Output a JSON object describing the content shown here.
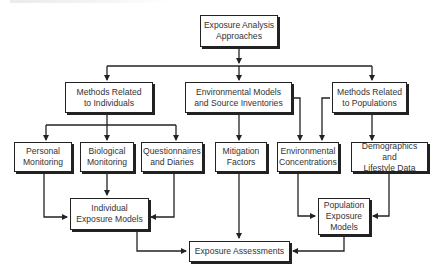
{
  "diagram": {
    "nodes": {
      "root": {
        "line1": "Exposure Analysis",
        "line2": "Approaches"
      },
      "individuals": {
        "line1": "Methods Related",
        "line2": "to Individuals"
      },
      "environmental_models": {
        "line1": "Environmental Models",
        "line2": "and Source Inventories"
      },
      "populations": {
        "line1": "Methods Related",
        "line2": "to Populations"
      },
      "personal_monitoring": {
        "line1": "Personal",
        "line2": "Monitoring"
      },
      "biological_monitoring": {
        "line1": "Biological",
        "line2": "Monitoring"
      },
      "questionnaires": {
        "line1": "Questionnaires",
        "line2": "and Diaries"
      },
      "mitigation": {
        "line1": "Mitigation",
        "line2": "Factors"
      },
      "env_concentrations": {
        "line1": "Environmental",
        "line2": "Concentrations"
      },
      "demographics": {
        "line1": "Demographics and",
        "line2": "Lifestyle Data"
      },
      "individual_models": {
        "line1": "Individual",
        "line2": "Exposure Models"
      },
      "population_models": {
        "line1": "Population",
        "line2": "Exposure",
        "line3": "Models"
      },
      "assessments": {
        "line1": "Exposure Assessments"
      }
    },
    "edges": [
      [
        "Exposure Analysis Approaches",
        "Methods Related to Individuals"
      ],
      [
        "Exposure Analysis Approaches",
        "Environmental Models and Source Inventories"
      ],
      [
        "Exposure Analysis Approaches",
        "Methods Related to Populations"
      ],
      [
        "Methods Related to Individuals",
        "Personal Monitoring"
      ],
      [
        "Methods Related to Individuals",
        "Biological Monitoring"
      ],
      [
        "Methods Related to Individuals",
        "Questionnaires and Diaries"
      ],
      [
        "Environmental Models and Source Inventories",
        "Mitigation Factors"
      ],
      [
        "Environmental Models and Source Inventories",
        "Environmental Concentrations"
      ],
      [
        "Methods Related to Populations",
        "Environmental Concentrations"
      ],
      [
        "Methods Related to Populations",
        "Demographics and Lifestyle Data"
      ],
      [
        "Personal Monitoring",
        "Individual Exposure Models"
      ],
      [
        "Biological Monitoring",
        "Individual Exposure Models"
      ],
      [
        "Questionnaires and Diaries",
        "Individual Exposure Models"
      ],
      [
        "Mitigation Factors",
        "Exposure Assessments"
      ],
      [
        "Environmental Concentrations",
        "Population Exposure Models"
      ],
      [
        "Demographics and Lifestyle Data",
        "Population Exposure Models"
      ],
      [
        "Individual Exposure Models",
        "Exposure Assessments"
      ],
      [
        "Population Exposure Models",
        "Exposure Assessments"
      ]
    ]
  }
}
